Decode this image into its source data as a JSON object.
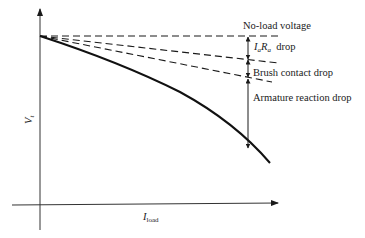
{
  "diagram": {
    "title": "",
    "axes": {
      "x_label": {
        "symbol": "I",
        "subscript": "load"
      },
      "y_label": {
        "symbol": "V",
        "subscript": "t"
      }
    },
    "lines": [
      {
        "name": "no-load-voltage",
        "style": "dashed",
        "label": "No-load voltage"
      },
      {
        "name": "after-ia-ra-drop",
        "style": "dashed"
      },
      {
        "name": "after-brush-drop",
        "style": "dashed"
      },
      {
        "name": "terminal-voltage-curve",
        "style": "solid"
      }
    ],
    "annotations": {
      "no_load": "No-load voltage",
      "iara": {
        "i": "I",
        "i_sub": "a",
        "r": "R",
        "r_sub": "a",
        "suffix": "drop"
      },
      "brush": "Brush contact drop",
      "armature": "Armature reaction drop"
    },
    "colors": {
      "line": "#1a1a1a",
      "background": "#ffffff"
    }
  }
}
